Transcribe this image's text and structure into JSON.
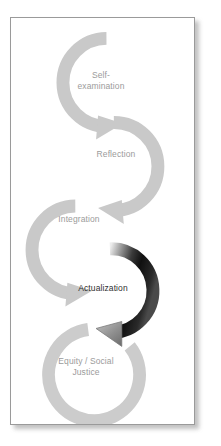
{
  "diagram": {
    "type": "process-cycle-chain",
    "background_color": "#ffffff",
    "frame_border_color": "#9a9a9a",
    "ring_color": "#c9c9c9",
    "label_color": "#9b9b9b",
    "highlight_label_color": "#2f2f2f",
    "highlight_arrow_gradient": [
      "#e8e8e8",
      "#141414",
      "#9a9a9a"
    ],
    "stages": [
      {
        "id": "self-examination",
        "label": "Self-\nexamination",
        "highlighted": false,
        "has_arrowhead": true
      },
      {
        "id": "reflection",
        "label": "Reflection",
        "highlighted": false,
        "has_arrowhead": true
      },
      {
        "id": "integration",
        "label": "Integration",
        "highlighted": false,
        "has_arrowhead": true
      },
      {
        "id": "actualization",
        "label": "Actualization",
        "highlighted": true,
        "has_arrowhead": true
      },
      {
        "id": "equity-social-justice",
        "label": "Equity / Social\nJustice",
        "highlighted": false,
        "has_arrowhead": false
      }
    ]
  }
}
